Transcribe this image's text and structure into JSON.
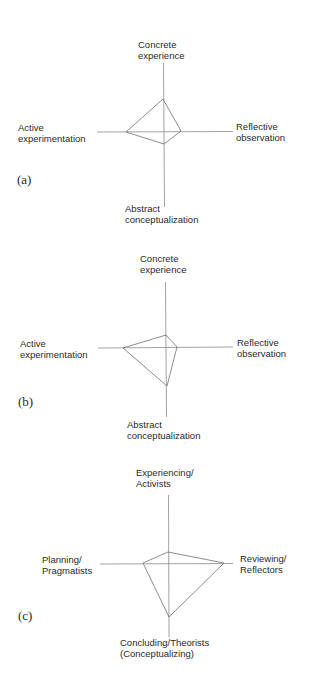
{
  "diagrams": [
    {
      "panel": "(a)",
      "labels": {
        "top": [
          "Concrete",
          "experience"
        ],
        "right": [
          "Reflective",
          "observation"
        ],
        "bottom": [
          "Abstract",
          "conceptualization"
        ],
        "left": [
          "Active",
          "experimentation"
        ]
      },
      "axes": {
        "cx": 164,
        "cy": 132,
        "top": 63,
        "bottom": 207,
        "left": 97,
        "right": 233
      },
      "polygon": {
        "top": [
          163,
          99
        ],
        "right": [
          181,
          131
        ],
        "bottom": [
          164,
          144
        ],
        "left": [
          126,
          132
        ]
      }
    },
    {
      "panel": "(b)",
      "labels": {
        "top": [
          "Concrete",
          "experience"
        ],
        "right": [
          "Reflective",
          "observation"
        ],
        "bottom": [
          "Abstract",
          "conceptualization"
        ],
        "left": [
          "Active",
          "experimentation"
        ]
      },
      "axes": {
        "cx": 166,
        "cy": 348,
        "top": 282,
        "bottom": 417,
        "left": 98,
        "right": 233
      },
      "polygon": {
        "top": [
          166,
          335
        ],
        "right": [
          177,
          347
        ],
        "bottom": [
          167,
          386
        ],
        "left": [
          123,
          348
        ]
      }
    },
    {
      "panel": "(c)",
      "labels": {
        "top": [
          "Experiencing/",
          "Activists"
        ],
        "right": [
          "Reviewing/",
          "Reflectors"
        ],
        "bottom": [
          "Concluding/Theorists",
          "(Conceptualizing)"
        ],
        "left": [
          "Planning/",
          "Pragmatists"
        ]
      },
      "axes": {
        "cx": 169,
        "cy": 564,
        "top": 495,
        "bottom": 637,
        "left": 100,
        "right": 233
      },
      "polygon": {
        "top": [
          168,
          552
        ],
        "right": [
          224,
          563
        ],
        "bottom": [
          169,
          617
        ],
        "left": [
          143,
          563
        ]
      }
    }
  ],
  "style": {
    "line_color": "#8a8a8a",
    "polygon_color": "#707070",
    "text_color": "#2a2a2a"
  }
}
